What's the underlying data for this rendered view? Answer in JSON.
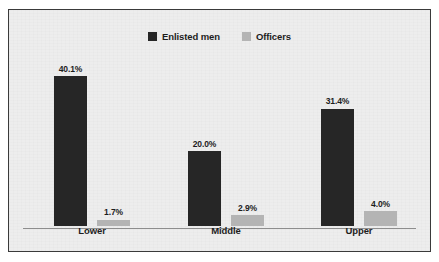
{
  "chart_data": {
    "type": "bar",
    "title": "",
    "subtitle": "",
    "xlabel": "",
    "ylabel": "",
    "grid": false,
    "legend_position": "top-center",
    "ylim": [
      0,
      45
    ],
    "value_suffix": "%",
    "categories": [
      "Lower",
      "Middle",
      "Upper"
    ],
    "series": [
      {
        "name": "Enlisted men",
        "color": "#262626",
        "values": [
          40.1,
          20.0,
          31.4
        ],
        "labels": [
          "40.1%",
          "20.0%",
          "31.4%"
        ]
      },
      {
        "name": "Officers",
        "color": "#b4b4b4",
        "values": [
          1.7,
          2.9,
          4.0
        ],
        "labels": [
          "1.7%",
          "2.9%",
          "4.0%"
        ]
      }
    ]
  },
  "figure": {
    "background_color": "#ededed",
    "border_color": "#3a3a3a",
    "axis_color": "#8d8d8d"
  }
}
